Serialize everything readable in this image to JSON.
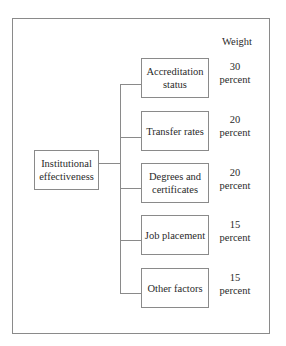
{
  "diagram": {
    "type": "hierarchy",
    "root": {
      "label": "Institutional effectiveness"
    },
    "weight_header": "Weight",
    "children": [
      {
        "label": "Accreditation status",
        "weight_value": "30",
        "weight_unit": "percent"
      },
      {
        "label": "Transfer rates",
        "weight_value": "20",
        "weight_unit": "percent"
      },
      {
        "label": "Degrees and certificates",
        "weight_value": "20",
        "weight_unit": "percent"
      },
      {
        "label": "Job placement",
        "weight_value": "15",
        "weight_unit": "percent"
      },
      {
        "label": "Other factors",
        "weight_value": "15",
        "weight_unit": "percent"
      }
    ],
    "colors": {
      "line": "#8a8a8a",
      "text": "#2a2a2a",
      "background": "#ffffff"
    }
  }
}
